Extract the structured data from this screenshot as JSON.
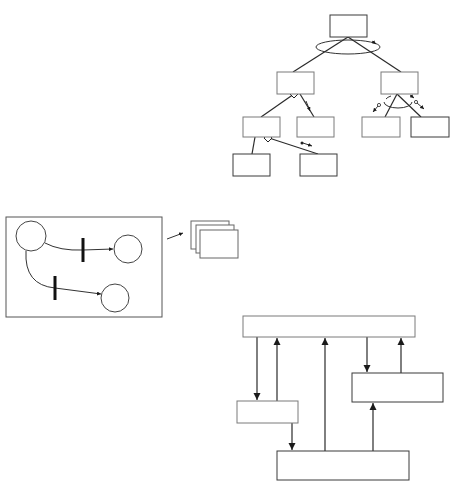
{
  "diagram": {
    "colors": {
      "line": "#2a2a2a",
      "box_stroke": "#7a7a7a",
      "background": "#ffffff"
    },
    "tree": {
      "description": "Hierarchical tree of unlabeled boxes with relationship markers (rotation ellipses, diamonds, small directional arrows)",
      "nodes": [
        {
          "id": "root",
          "x": 330,
          "y": 15,
          "w": 37,
          "h": 22
        },
        {
          "id": "l1-left",
          "x": 277,
          "y": 72,
          "w": 37,
          "h": 22
        },
        {
          "id": "l1-right",
          "x": 381,
          "y": 72,
          "w": 37,
          "h": 22
        },
        {
          "id": "l2-a",
          "x": 243,
          "y": 117,
          "w": 37,
          "h": 20
        },
        {
          "id": "l2-b",
          "x": 297,
          "y": 117,
          "w": 37,
          "h": 20
        },
        {
          "id": "l2-c",
          "x": 362,
          "y": 117,
          "w": 38,
          "h": 20
        },
        {
          "id": "l2-d",
          "x": 411,
          "y": 117,
          "w": 38,
          "h": 20
        },
        {
          "id": "l3-a",
          "x": 233,
          "y": 154,
          "w": 37,
          "h": 22
        },
        {
          "id": "l3-b",
          "x": 300,
          "y": 154,
          "w": 37,
          "h": 22
        }
      ],
      "edges": [
        {
          "from": "root",
          "to": "l1-left"
        },
        {
          "from": "root",
          "to": "l1-right"
        },
        {
          "from": "l1-left",
          "to": "l2-a",
          "marker": "diamond"
        },
        {
          "from": "l1-left",
          "to": "l2-b"
        },
        {
          "from": "l1-right",
          "to": "l2-c"
        },
        {
          "from": "l1-right",
          "to": "l2-d"
        },
        {
          "from": "l2-a",
          "to": "l3-a"
        },
        {
          "from": "l2-a",
          "to": "l3-b",
          "marker": "diamond"
        }
      ]
    },
    "petri_net": {
      "description": "Framed Petri net with three places and two transitions, arrow pointing to stacked pages",
      "frame": {
        "x": 6,
        "y": 217,
        "w": 156,
        "h": 100
      },
      "places": [
        {
          "id": "p1",
          "cx": 31,
          "cy": 236,
          "r": 15
        },
        {
          "id": "p2",
          "cx": 128,
          "cy": 249,
          "r": 14
        },
        {
          "id": "p3",
          "cx": 115,
          "cy": 298,
          "r": 14
        }
      ],
      "transitions": [
        {
          "id": "t1",
          "x": 83,
          "y1": 238,
          "y2": 262
        },
        {
          "id": "t2",
          "x": 55,
          "y1": 276,
          "y2": 300
        }
      ],
      "pages_count": 3
    },
    "data_flow": {
      "description": "Block diagram with top bar, two side boxes and bottom box connected by vertical arrows",
      "blocks": [
        {
          "id": "top",
          "x": 243,
          "y": 316,
          "w": 172,
          "h": 21
        },
        {
          "id": "left",
          "x": 237,
          "y": 401,
          "w": 61,
          "h": 22
        },
        {
          "id": "right",
          "x": 352,
          "y": 373,
          "w": 91,
          "h": 29
        },
        {
          "id": "bottom",
          "x": 277,
          "y": 451,
          "w": 132,
          "h": 29
        }
      ],
      "arrows": [
        {
          "from": "top",
          "to": "left"
        },
        {
          "from": "left",
          "to": "top"
        },
        {
          "from": "bottom",
          "to": "top"
        },
        {
          "from": "top",
          "to": "right"
        },
        {
          "from": "right",
          "to": "top"
        },
        {
          "from": "left",
          "to": "bottom"
        },
        {
          "from": "bottom",
          "to": "right"
        }
      ]
    }
  }
}
